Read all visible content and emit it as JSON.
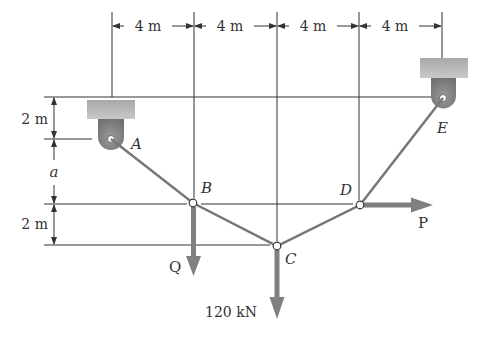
{
  "diagram": {
    "type": "cable-structure",
    "dimensions": {
      "horizontal": [
        "4 m",
        "4 m",
        "4 m",
        "4 m"
      ],
      "vertical": [
        "2 m",
        "a",
        "2 m"
      ]
    },
    "nodes": {
      "A": {
        "label": "A",
        "role": "pin-support"
      },
      "B": {
        "label": "B",
        "role": "joint"
      },
      "C": {
        "label": "C",
        "role": "joint"
      },
      "D": {
        "label": "D",
        "role": "joint"
      },
      "E": {
        "label": "E",
        "role": "pin-support"
      }
    },
    "loads": {
      "Q": {
        "label": "Q",
        "at": "B",
        "direction": "down"
      },
      "C_load": {
        "label": "120 kN",
        "at": "C",
        "direction": "down"
      },
      "P": {
        "label": "P",
        "at": "D",
        "direction": "right"
      }
    },
    "colors": {
      "cable": "#777777",
      "force_arrow": "#8a8a8a",
      "support_block": "#b5b5b5",
      "line": "#333333"
    }
  }
}
